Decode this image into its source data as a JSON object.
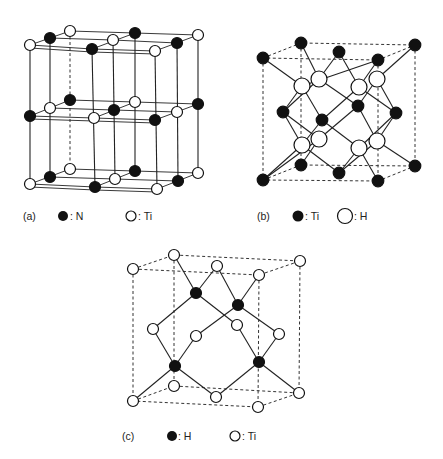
{
  "figure": {
    "panels": [
      {
        "id": "a",
        "label": "(a)",
        "legend": [
          {
            "symbol": "filled-circle",
            "text": ": N"
          },
          {
            "symbol": "open-circle",
            "text": ": Ti"
          }
        ],
        "description": "Layered tetragonal cell; alternating N and Ti atoms in three horizontal layers"
      },
      {
        "id": "b",
        "label": "(b)",
        "legend": [
          {
            "symbol": "filled-circle",
            "text": ": Ti"
          },
          {
            "symbol": "open-circle",
            "text": ": H"
          }
        ],
        "description": "Fluorite-type TiH2 cell; Ti at corners and face centers, H in tetrahedral sites"
      },
      {
        "id": "c",
        "label": "(c)",
        "legend": [
          {
            "symbol": "filled-circle",
            "text": ": H"
          },
          {
            "symbol": "open-circle",
            "text": ": Ti"
          }
        ],
        "description": "FCC Ti lattice with H occupying tetrahedral sites"
      }
    ],
    "colors": {
      "filled": "#111111",
      "open": "#ffffff",
      "line": "#222222"
    }
  }
}
